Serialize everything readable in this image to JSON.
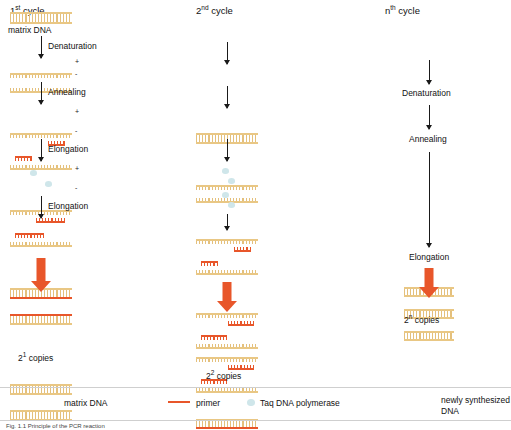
{
  "figure": {
    "columns": [
      {
        "id": "first-cycle",
        "title_main": "1",
        "title_sup": "st",
        "title_rest": " cycle",
        "matrix_label": "matrix DNA",
        "steps": [
          "Denaturation",
          "Annealing",
          "Elongation",
          "Elongation"
        ],
        "result_main": "2",
        "result_sup": "1",
        "result_rest": " copies",
        "signs": [
          "+",
          "-",
          "+",
          "-",
          "+",
          "-"
        ]
      },
      {
        "id": "second-cycle",
        "title_main": "2",
        "title_sup": "nd",
        "title_rest": " cycle",
        "steps": [],
        "result_main": "2",
        "result_sup": "2",
        "result_rest": " copies"
      },
      {
        "id": "nth-cycle",
        "title_main": "n",
        "title_sup": "th",
        "title_rest": " cycle",
        "steps": [
          "Denaturation",
          "Annealing",
          "Elongation"
        ],
        "result_main": "2",
        "result_sup": "n",
        "result_rest": " copies"
      }
    ],
    "legend": [
      {
        "id": "matrix-dna",
        "label": "matrix DNA",
        "swatch": "dna-block"
      },
      {
        "id": "primer",
        "label": "primer",
        "swatch": "red-line",
        "color": "#e8562a"
      },
      {
        "id": "taq-polymerase",
        "label": "Taq DNA polymerase",
        "swatch": "blob",
        "color": "#cfe6ea"
      },
      {
        "id": "newly-synthesized",
        "label_line1": "newly synthesized",
        "label_line2": "DNA",
        "swatch": "dna-block-pair"
      }
    ],
    "caption": "Fig. 1.1  Principle of the PCR reaction",
    "colors": {
      "dna_gold": "#e9c784",
      "primer_red": "#e8562a",
      "polymerase_blue": "#cfe6ea",
      "text": "#111111"
    }
  }
}
